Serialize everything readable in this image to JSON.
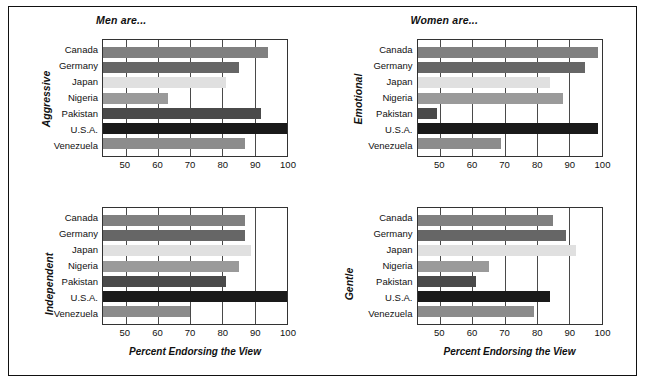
{
  "figure": {
    "column_titles": [
      "Men are...",
      "Women are..."
    ],
    "x_axis_title": "Percent Endorsing the View",
    "x_ticks": [
      50,
      60,
      70,
      80,
      90,
      100
    ],
    "x_min": 43,
    "x_max": 100,
    "categories": [
      "Canada",
      "Germany",
      "Japan",
      "Nigeria",
      "Pakistan",
      "U.S.A.",
      "Venezuela"
    ],
    "category_colors": [
      "#808080",
      "#666666",
      "#e0e0e0",
      "#9a9a9a",
      "#4a4a4a",
      "#1a1a1a",
      "#8c8c8c"
    ],
    "frame_color": "#111111"
  },
  "chart_data": [
    {
      "type": "bar",
      "title": "Aggressive",
      "panel_position": "top-left",
      "group_title": "Men are...",
      "categories": [
        "Canada",
        "Germany",
        "Japan",
        "Nigeria",
        "Pakistan",
        "U.S.A.",
        "Venezuela"
      ],
      "values": [
        94,
        85,
        81,
        63,
        92,
        100,
        87
      ],
      "xlabel": "Percent Endorsing the View",
      "ylabel": "Aggressive",
      "xlim": [
        43,
        100
      ],
      "xticks": [
        50,
        60,
        70,
        80,
        90,
        100
      ],
      "orientation": "horizontal",
      "grid": "vertical"
    },
    {
      "type": "bar",
      "title": "Emotional",
      "panel_position": "top-right",
      "group_title": "Women are...",
      "categories": [
        "Canada",
        "Germany",
        "Japan",
        "Nigeria",
        "Pakistan",
        "U.S.A.",
        "Venezuela"
      ],
      "values": [
        99,
        95,
        84,
        88,
        49,
        99,
        69
      ],
      "xlabel": "Percent Endorsing the View",
      "ylabel": "Emotional",
      "xlim": [
        43,
        100
      ],
      "xticks": [
        50,
        60,
        70,
        80,
        90,
        100
      ],
      "orientation": "horizontal",
      "grid": "vertical"
    },
    {
      "type": "bar",
      "title": "Independent",
      "panel_position": "bottom-left",
      "group_title": "Men are...",
      "categories": [
        "Canada",
        "Germany",
        "Japan",
        "Nigeria",
        "Pakistan",
        "U.S.A.",
        "Venezuela"
      ],
      "values": [
        87,
        87,
        89,
        85,
        81,
        100,
        70
      ],
      "xlabel": "Percent Endorsing the View",
      "ylabel": "Independent",
      "xlim": [
        43,
        100
      ],
      "xticks": [
        50,
        60,
        70,
        80,
        90,
        100
      ],
      "orientation": "horizontal",
      "grid": "vertical"
    },
    {
      "type": "bar",
      "title": "Gentle",
      "panel_position": "bottom-right",
      "group_title": "Women are...",
      "categories": [
        "Canada",
        "Germany",
        "Japan",
        "Nigeria",
        "Pakistan",
        "U.S.A.",
        "Venezuela"
      ],
      "values": [
        85,
        89,
        92,
        65,
        61,
        84,
        79
      ],
      "xlabel": "Percent Endorsing the View",
      "ylabel": "Gentle",
      "xlim": [
        43,
        100
      ],
      "xticks": [
        50,
        60,
        70,
        80,
        90,
        100
      ],
      "orientation": "horizontal",
      "grid": "vertical"
    }
  ]
}
